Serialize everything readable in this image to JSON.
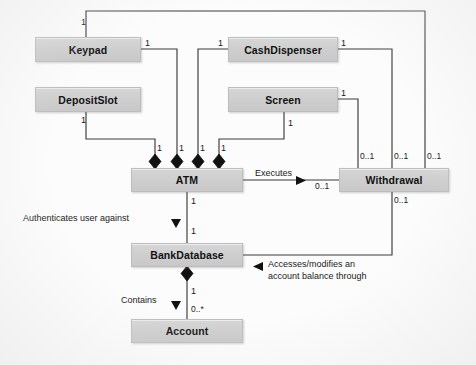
{
  "diagram": {
    "type": "uml-class-diagram",
    "background_color": "#fcfcfc",
    "node_fill": "#cfcfcf",
    "line_color": "#3a3a3a"
  },
  "classes": [
    {
      "id": "keypad",
      "name": "Keypad",
      "x": 35,
      "y": 37,
      "w": 106,
      "h": 25
    },
    {
      "id": "cashdispenser",
      "name": "CashDispenser",
      "x": 228,
      "y": 37,
      "w": 110,
      "h": 25
    },
    {
      "id": "depositslot",
      "name": "DepositSlot",
      "x": 35,
      "y": 87,
      "w": 106,
      "h": 25
    },
    {
      "id": "screen",
      "name": "Screen",
      "x": 228,
      "y": 87,
      "w": 110,
      "h": 25
    },
    {
      "id": "atm",
      "name": "ATM",
      "x": 131,
      "y": 168,
      "w": 112,
      "h": 24
    },
    {
      "id": "withdrawal",
      "name": "Withdrawal",
      "x": 339,
      "y": 168,
      "w": 110,
      "h": 24
    },
    {
      "id": "bankdatabase",
      "name": "BankDatabase",
      "x": 131,
      "y": 243,
      "w": 112,
      "h": 24
    },
    {
      "id": "account",
      "name": "Account",
      "x": 131,
      "y": 319,
      "w": 112,
      "h": 24
    }
  ],
  "association_labels": [
    {
      "id": "executes",
      "text": "Executes",
      "x": 255,
      "y": 168
    },
    {
      "id": "authenticates",
      "text": "Authenticates user against",
      "x": 72,
      "y": 214
    },
    {
      "id": "accesses1",
      "text": "Accesses/modifies an",
      "x": 268,
      "y": 261
    },
    {
      "id": "accesses2",
      "text": "account balance through",
      "x": 268,
      "y": 272
    },
    {
      "id": "contains",
      "text": "Contains",
      "x": 139,
      "y": 295
    }
  ],
  "multiplicities": [
    {
      "id": "m-keypad-top",
      "text": "1",
      "x": 81,
      "y": 18
    },
    {
      "id": "m-keypad-right",
      "text": "1",
      "x": 145,
      "y": 40
    },
    {
      "id": "m-cashdisp-left",
      "text": "1",
      "x": 218,
      "y": 40
    },
    {
      "id": "m-cashdisp-right",
      "text": "1",
      "x": 341,
      "y": 40
    },
    {
      "id": "m-depositslot-bot",
      "text": "1",
      "x": 81,
      "y": 115
    },
    {
      "id": "m-screen-right",
      "text": "1",
      "x": 341,
      "y": 90
    },
    {
      "id": "m-screen-bot",
      "text": "1",
      "x": 284,
      "y": 118
    },
    {
      "id": "m-atm-a1",
      "text": "1",
      "x": 155,
      "y": 147
    },
    {
      "id": "m-atm-a2",
      "text": "1",
      "x": 177,
      "y": 147
    },
    {
      "id": "m-atm-a3",
      "text": "1",
      "x": 198,
      "y": 147
    },
    {
      "id": "m-atm-a4",
      "text": "1",
      "x": 219,
      "y": 147
    },
    {
      "id": "m-wd-top1",
      "text": "0..1",
      "x": 358,
      "y": 152
    },
    {
      "id": "m-wd-top2",
      "text": "0..1",
      "x": 392,
      "y": 152
    },
    {
      "id": "m-wd-top3",
      "text": "0..1",
      "x": 424,
      "y": 152
    },
    {
      "id": "m-wd-left",
      "text": "0..1",
      "x": 316,
      "y": 181
    },
    {
      "id": "m-wd-bot",
      "text": "0..1",
      "x": 392,
      "y": 196
    },
    {
      "id": "m-atm-bot",
      "text": "1",
      "x": 190,
      "y": 198
    },
    {
      "id": "m-bankdb-top",
      "text": "1",
      "x": 190,
      "y": 228
    },
    {
      "id": "m-bankdb-bot",
      "text": "1",
      "x": 190,
      "y": 288
    },
    {
      "id": "m-account-top",
      "text": "0..*",
      "x": 190,
      "y": 306
    }
  ],
  "relationships": [
    {
      "from": "keypad",
      "to": "atm",
      "kind": "composition"
    },
    {
      "from": "cashdispenser",
      "to": "atm",
      "kind": "composition"
    },
    {
      "from": "depositslot",
      "to": "atm",
      "kind": "composition"
    },
    {
      "from": "screen",
      "to": "atm",
      "kind": "composition"
    },
    {
      "from": "atm",
      "to": "withdrawal",
      "kind": "association",
      "label": "Executes"
    },
    {
      "from": "atm",
      "to": "bankdatabase",
      "kind": "association",
      "label": "Authenticates user against"
    },
    {
      "from": "bankdatabase",
      "to": "account",
      "kind": "composition",
      "label": "Contains"
    },
    {
      "from": "withdrawal",
      "to": "bankdatabase",
      "kind": "association",
      "label": "Accesses/modifies an account balance through"
    },
    {
      "from": "withdrawal",
      "to": "keypad",
      "kind": "association"
    },
    {
      "from": "withdrawal",
      "to": "cashdispenser",
      "kind": "association"
    },
    {
      "from": "withdrawal",
      "to": "screen",
      "kind": "association"
    }
  ]
}
